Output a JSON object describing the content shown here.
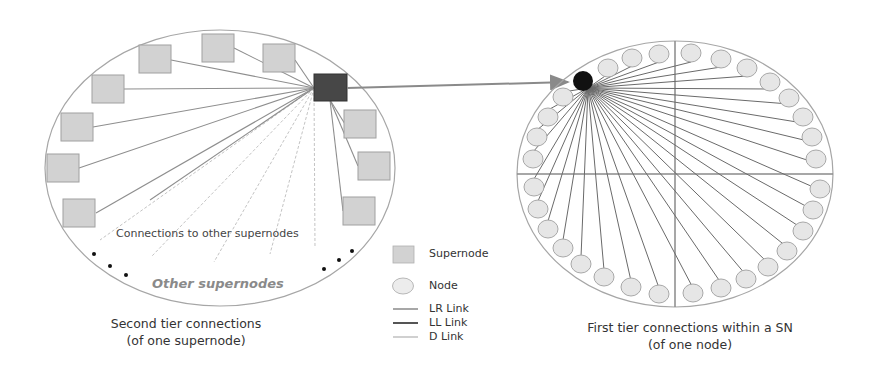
{
  "left_panel": {
    "inner_label": "Connections to other supernodes",
    "outer_label": "Other supernodes",
    "caption_line1": "Second tier connections",
    "caption_line2": "(of one supernode)"
  },
  "right_panel": {
    "caption_line1": "First tier connections within a SN",
    "caption_line2": "(of one node)"
  },
  "legend": {
    "items": [
      {
        "icon": "square",
        "label": "Supernode"
      },
      {
        "icon": "circle",
        "label": "Node"
      },
      {
        "icon": "line",
        "label": "LR Link"
      },
      {
        "icon": "line",
        "label": "LL Link"
      },
      {
        "icon": "line",
        "label": "D Link"
      }
    ]
  },
  "colors": {
    "supernode_fill": "#d2d2d2",
    "supernode_stroke": "#9a9a9a",
    "selected_supernode": "#444444",
    "node_fill": "#e4e4e4",
    "node_stroke": "#a8a8a8",
    "selected_node": "#111111",
    "lr_link": "#8a8a8a",
    "ll_link": "#555555",
    "d_link": "#c0c0c0",
    "ellipse_stroke": "#a0a0a0"
  }
}
